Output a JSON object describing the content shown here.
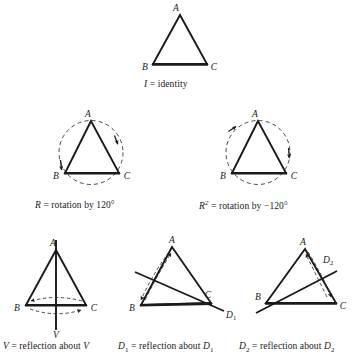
{
  "figure": {
    "colors": {
      "stroke": "#1a1a1a",
      "dashed": "#333333",
      "background": "#ffffff"
    },
    "vertex_labels": {
      "a": "A",
      "b": "B",
      "c": "C"
    }
  },
  "panels": [
    {
      "id": "identity",
      "caption_symbol": "I",
      "caption_text": " = identity",
      "caption_full": "I = identity",
      "vertices": {
        "a": "A",
        "b": "B",
        "c": "C"
      },
      "has_circle": false,
      "axis_label": ""
    },
    {
      "id": "rotation-r",
      "caption_symbol": "R",
      "caption_text": " = rotation by 120°",
      "caption_full": "R = rotation by 120°",
      "vertices": {
        "a": "A",
        "b": "B",
        "c": "C"
      },
      "has_circle": true,
      "rotation_degrees": "120°",
      "direction": "counterclockwise",
      "axis_label": ""
    },
    {
      "id": "rotation-r2",
      "caption_symbol": "R",
      "caption_superscript": "2",
      "caption_text": " = rotation by −120°",
      "caption_full": "R2 = rotation by -120°",
      "vertices": {
        "a": "A",
        "b": "B",
        "c": "C"
      },
      "has_circle": true,
      "rotation_degrees": "−120°",
      "direction": "clockwise",
      "axis_label": ""
    },
    {
      "id": "reflection-v",
      "caption_symbol": "V",
      "caption_text": " = reflection about ",
      "caption_symbol2": "V",
      "caption_full": "V = reflection about V",
      "vertices": {
        "a": "A",
        "b": "B",
        "c": "C"
      },
      "has_circle": false,
      "axis_label": "V",
      "swaps": "B and C"
    },
    {
      "id": "reflection-d1",
      "caption_symbol": "D",
      "caption_subscript": "1",
      "caption_text": " = reflection about ",
      "caption_symbol2": "D",
      "caption_subscript2": "1",
      "caption_full": "D1 = reflection about D1",
      "vertices": {
        "a": "A",
        "b": "B",
        "c": "C"
      },
      "has_circle": false,
      "axis_label": "D",
      "axis_label_sub": "1",
      "swaps": "A and B"
    },
    {
      "id": "reflection-d2",
      "caption_symbol": "D",
      "caption_subscript": "2",
      "caption_text": " = reflection about ",
      "caption_symbol2": "D",
      "caption_subscript2": "2",
      "caption_full": "D2 = reflection about D2",
      "vertices": {
        "a": "A",
        "b": "B",
        "c": "C"
      },
      "has_circle": false,
      "axis_label": "D",
      "axis_label_sub": "2",
      "swaps": "A and C"
    }
  ]
}
